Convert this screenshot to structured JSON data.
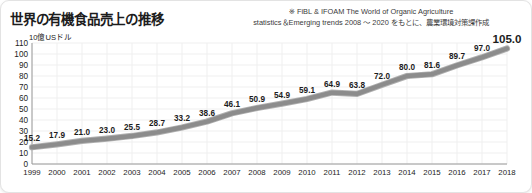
{
  "header": {
    "title": "世界の有機食品売上の推移",
    "attribution_line1": "※ FiBL & IFOAM The World of Organic Agriculture",
    "attribution_line2": "statistics＆Emerging trends 2008 〜 2020 をもとに、農業環境対策課作成"
  },
  "axis": {
    "unit_label": "10億USドル"
  },
  "colors": {
    "line": "#8c8c8c",
    "line_edge": "#b0b0b0",
    "grid": "#efefef",
    "axis": "#9a9a9a",
    "text": "#1c1c1c",
    "card_bg": "#ffffff",
    "card_border": "#e3e3e3"
  },
  "chart_data": {
    "type": "line",
    "title": "世界の有機食品売上の推移",
    "xlabel": "",
    "ylabel": "10億USドル",
    "ylim": [
      0,
      110
    ],
    "yticks": [
      0,
      10,
      20,
      30,
      40,
      50,
      60,
      70,
      80,
      90,
      100,
      110
    ],
    "ytick_labels": [
      "0",
      "10",
      "20",
      "30",
      "40",
      "50",
      "60",
      "70",
      "80",
      "90",
      "100",
      "110"
    ],
    "grid": true,
    "legend": false,
    "categories": [
      "1999",
      "2000",
      "2001",
      "2002",
      "2003",
      "2004",
      "2005",
      "2006",
      "2007",
      "2008",
      "2009",
      "2010",
      "2011",
      "2012",
      "2013",
      "2014",
      "2015",
      "2016",
      "2017",
      "2018"
    ],
    "values": [
      15.2,
      17.9,
      21.0,
      23.0,
      25.5,
      28.7,
      33.2,
      38.6,
      46.1,
      50.9,
      54.9,
      59.1,
      64.9,
      63.8,
      72.0,
      80.0,
      81.6,
      89.7,
      97.0,
      105.0
    ],
    "value_labels": [
      "15.2",
      "17.9",
      "21.0",
      "23.0",
      "25.5",
      "28.7",
      "33.2",
      "38.6",
      "46.1",
      "50.9",
      "54.9",
      "59.1",
      "64.9",
      "63.8",
      "72.0",
      "80.0",
      "81.6",
      "89.7",
      "97.0",
      "105.0"
    ]
  }
}
